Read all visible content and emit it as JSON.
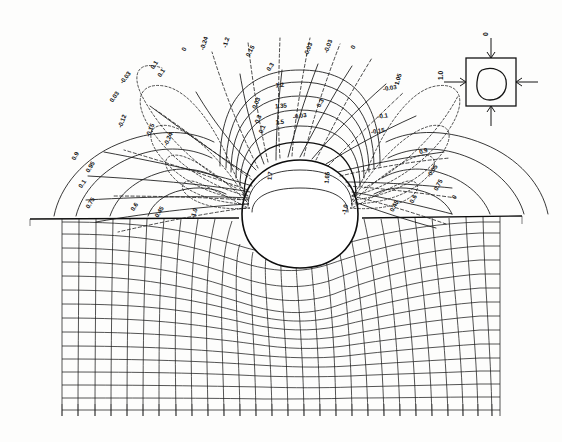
{
  "figure": {
    "kind": "contour-plot-with-deformed-mesh",
    "background_color": "#fdfdfc",
    "ink_color": "#141414"
  },
  "chart_data": {
    "type": "line",
    "title": "",
    "subtitle": "",
    "xlabel": "",
    "ylabel": "",
    "grid": false,
    "legend_position": "none",
    "styles": {
      "solid": "principal stress trajectory / positive contour",
      "dashed": "negative (tensile) contour",
      "mesh": "deformed finite-element grid"
    },
    "contour_labels": [
      {
        "text": "0.9",
        "x": 77,
        "y": 157,
        "rot": -62,
        "style": "solid"
      },
      {
        "text": "0.95",
        "x": 92,
        "y": 168,
        "rot": -58,
        "style": "solid"
      },
      {
        "text": "0.1",
        "x": 84,
        "y": 185,
        "rot": -55,
        "style": "dashed"
      },
      {
        "text": "0.75",
        "x": 92,
        "y": 204,
        "rot": -58,
        "style": "solid"
      },
      {
        "text": "0.6",
        "x": 136,
        "y": 208,
        "rot": -56,
        "style": "solid"
      },
      {
        "text": "0.45",
        "x": 161,
        "y": 213,
        "rot": -58,
        "style": "solid"
      },
      {
        "text": "-1.0",
        "x": 196,
        "y": 214,
        "rot": -72,
        "style": "dashed"
      },
      {
        "text": "-0.03",
        "x": 127,
        "y": 79,
        "rot": -52,
        "style": "dashed"
      },
      {
        "text": "0.03",
        "x": 116,
        "y": 98,
        "rot": -56,
        "style": "dashed"
      },
      {
        "text": "-0.12",
        "x": 124,
        "y": 122,
        "rot": -68,
        "style": "dashed"
      },
      {
        "text": "-0.15",
        "x": 152,
        "y": 131,
        "rot": -68,
        "style": "dashed"
      },
      {
        "text": "-0.24",
        "x": 170,
        "y": 140,
        "rot": -66,
        "style": "dashed"
      },
      {
        "text": "0.1",
        "x": 156,
        "y": 66,
        "rot": -58,
        "style": "solid"
      },
      {
        "text": "0.1",
        "x": 163,
        "y": 74,
        "rot": -58,
        "style": "solid"
      },
      {
        "text": "0",
        "x": 186,
        "y": 50,
        "rot": -68,
        "style": "solid"
      },
      {
        "text": "-0.24",
        "x": 206,
        "y": 44,
        "rot": -72,
        "style": "dashed"
      },
      {
        "text": "-1.2",
        "x": 228,
        "y": 43,
        "rot": -74,
        "style": "dashed"
      },
      {
        "text": "0.15",
        "x": 252,
        "y": 52,
        "rot": -62,
        "style": "solid"
      },
      {
        "text": "0.3",
        "x": 272,
        "y": 68,
        "rot": -58,
        "style": "solid"
      },
      {
        "text": "1.2",
        "x": 280,
        "y": 87,
        "rot": -6,
        "style": "solid"
      },
      {
        "text": "1.35",
        "x": 281,
        "y": 108,
        "rot": -6,
        "style": "solid"
      },
      {
        "text": "1.5",
        "x": 280,
        "y": 124,
        "rot": -6,
        "style": "solid"
      },
      {
        "text": "0.03",
        "x": 258,
        "y": 104,
        "rot": -66,
        "style": "dashed"
      },
      {
        "text": "0.3",
        "x": 260,
        "y": 120,
        "rot": -66,
        "style": "dashed"
      },
      {
        "text": "0.1",
        "x": 264,
        "y": 130,
        "rot": -66,
        "style": "dashed"
      },
      {
        "text": "1.7",
        "x": 272,
        "y": 176,
        "rot": -84,
        "style": "solid"
      },
      {
        "text": "1.65",
        "x": 329,
        "y": 178,
        "rot": -84,
        "style": "solid"
      },
      {
        "text": "-1.0",
        "x": 347,
        "y": 210,
        "rot": -78,
        "style": "dashed"
      },
      {
        "text": "-0.03",
        "x": 310,
        "y": 50,
        "rot": -70,
        "style": "dashed"
      },
      {
        "text": "-0.03",
        "x": 330,
        "y": 47,
        "rot": -70,
        "style": "dashed"
      },
      {
        "text": "0",
        "x": 355,
        "y": 48,
        "rot": -66,
        "style": "solid"
      },
      {
        "text": "0.3",
        "x": 322,
        "y": 104,
        "rot": -62,
        "style": "dashed"
      },
      {
        "text": "-0.03",
        "x": 300,
        "y": 118,
        "rot": -10,
        "style": "dashed"
      },
      {
        "text": "1.05",
        "x": 400,
        "y": 80,
        "rot": -74,
        "style": "solid"
      },
      {
        "text": "-0.03",
        "x": 390,
        "y": 90,
        "rot": -8,
        "style": "dashed"
      },
      {
        "text": "-0.1",
        "x": 383,
        "y": 118,
        "rot": -8,
        "style": "dashed"
      },
      {
        "text": "-0.15",
        "x": 378,
        "y": 133,
        "rot": -8,
        "style": "dashed"
      },
      {
        "text": "0.9",
        "x": 424,
        "y": 153,
        "rot": -18,
        "style": "solid"
      },
      {
        "text": "-0.05",
        "x": 434,
        "y": 172,
        "rot": -56,
        "style": "dashed"
      },
      {
        "text": "0.75",
        "x": 440,
        "y": 186,
        "rot": -62,
        "style": "solid"
      },
      {
        "text": "0.6",
        "x": 415,
        "y": 200,
        "rot": -62,
        "style": "solid"
      },
      {
        "text": "0.45",
        "x": 396,
        "y": 207,
        "rot": -62,
        "style": "solid"
      },
      {
        "text": "0",
        "x": 456,
        "y": 198,
        "rot": -62,
        "style": "solid"
      }
    ]
  },
  "inset": {
    "name": "loading-key-diagram",
    "top_load_label": "0",
    "left_load_label": "1.0",
    "shape": "square plate with circular cavity, biaxial load arrows"
  }
}
